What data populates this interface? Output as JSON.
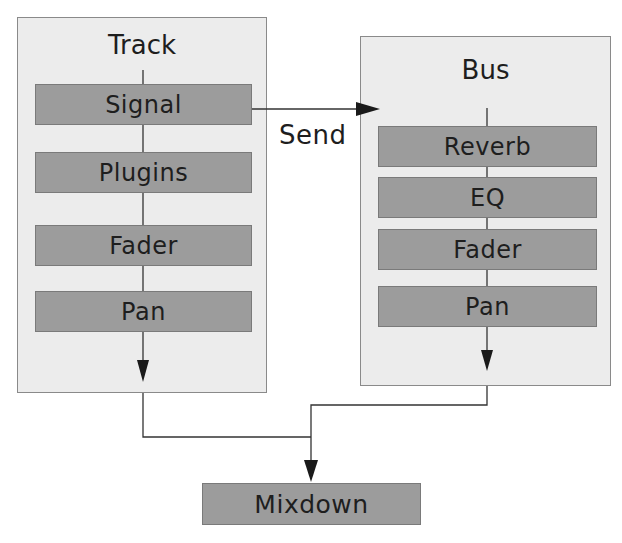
{
  "track": {
    "title": "Track",
    "nodes": [
      "Signal",
      "Plugins",
      "Fader",
      "Pan"
    ]
  },
  "bus": {
    "title": "Bus",
    "nodes": [
      "Reverb",
      "EQ",
      "Fader",
      "Pan"
    ]
  },
  "send_label": "Send",
  "output": {
    "label": "Mixdown"
  },
  "colors": {
    "container_bg": "#ececec",
    "node_bg": "#9c9c9c",
    "line": "#333333"
  }
}
